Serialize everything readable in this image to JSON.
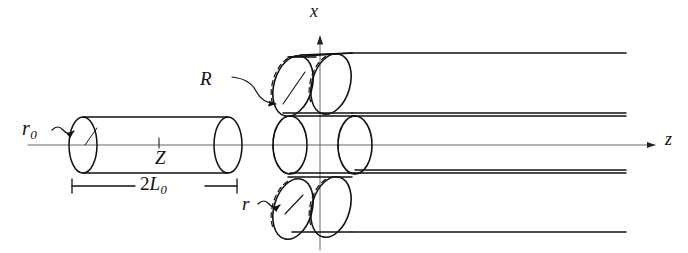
{
  "figure": {
    "background_color": "#ffffff",
    "stroke_color": "#111111",
    "axis_color": "#555555"
  },
  "axes": {
    "x_axis": {
      "label": "x",
      "orientation": "vertical",
      "arrow": "up",
      "x": 320,
      "tip_y": 30,
      "base_y": 250
    },
    "z_axis": {
      "label": "z",
      "orientation": "horizontal",
      "arrow": "right",
      "y": 145,
      "start_x": 28,
      "tip_x": 660
    }
  },
  "labels": {
    "r0": {
      "text": "r",
      "sub": "0",
      "leader": "wavy-arrow",
      "points_to": "initial-cylinder-radius"
    },
    "Z": {
      "text": "Z",
      "leader": "tick",
      "points_to": "cylinder-axis-midpoint"
    },
    "two_L0": {
      "prefix": "2",
      "italic": "L",
      "sub": "0",
      "text": "2L0",
      "leader": "dimension-line",
      "points_to": "initial-cylinder-length"
    },
    "R": {
      "text": "R",
      "leader": "curved-arrow",
      "points_to": "upper-droplet-radius"
    },
    "r": {
      "text": "r",
      "leader": "wavy-arrow",
      "points_to": "lower-droplet-radius"
    },
    "x": {
      "text": "x"
    },
    "z": {
      "text": "z"
    }
  },
  "objects": {
    "initial_cylinder": {
      "name": "initial-cylinder",
      "left_cap_center_x": 83,
      "right_cap_center_x": 228,
      "cap_rx": 14,
      "cap_ry": 28,
      "axis_y": 145,
      "top_edge_y": 117,
      "bottom_edge_y": 173
    },
    "dimension_line": {
      "left_x": 72,
      "right_x": 237,
      "y": 186,
      "tick_half_height": 7
    },
    "cylinder_groups": [
      {
        "name": "upper-cylinder-row",
        "axis_y": 83,
        "tilted": true,
        "count": 2,
        "long_lines_y": [
          53,
          113
        ]
      },
      {
        "name": "middle-cylinder-row",
        "axis_y": 145,
        "tilted": false,
        "count": 2,
        "long_lines_y": [
          115,
          170
        ]
      },
      {
        "name": "lower-cylinder-row",
        "axis_y": 208,
        "tilted": true,
        "count": 2,
        "long_lines_y": [
          177,
          232
        ]
      }
    ],
    "long_lines_end_x": 626
  }
}
